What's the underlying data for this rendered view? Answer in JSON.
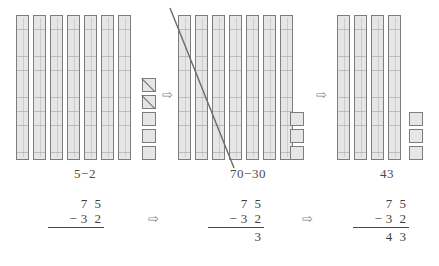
{
  "figure": {
    "arrow_glyph": "⇨",
    "colors": {
      "block_fill": "#e6e6e6",
      "block_border": "#7d7d7d",
      "text": "#4a4a4a",
      "strike": "#6b6b6b",
      "background": "#ffffff"
    }
  },
  "stages": [
    {
      "id": "stage-ones",
      "label": "5−2",
      "rods_count": 7,
      "units_count": 5,
      "units_struck": 2,
      "rods_struck": 0,
      "sum": {
        "minuend": "7 5",
        "operator": "−",
        "subtrahend": "3 2",
        "result": ""
      }
    },
    {
      "id": "stage-tens",
      "label": "70−30",
      "rods_count": 7,
      "units_count": 3,
      "units_struck": 0,
      "rods_struck": 3,
      "sum": {
        "minuend": "7 5",
        "operator": "−",
        "subtrahend": "3 2",
        "result": "3"
      }
    },
    {
      "id": "stage-answer",
      "label": "43",
      "rods_count": 4,
      "units_count": 3,
      "units_struck": 0,
      "rods_struck": 0,
      "sum": {
        "minuend": "7 5",
        "operator": "−",
        "subtrahend": "3 2",
        "result": "4 3"
      }
    }
  ],
  "arrows": {
    "blocks_1_2": "⇨",
    "blocks_2_3": "⇨",
    "sums_1_2": "⇨",
    "sums_2_3": "⇨"
  }
}
